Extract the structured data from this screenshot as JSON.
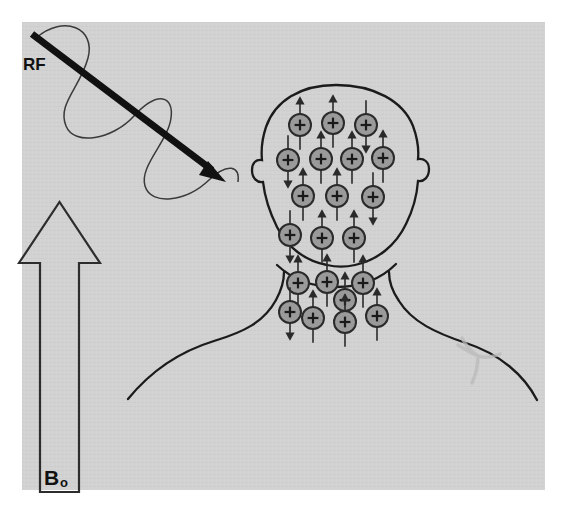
{
  "figure": {
    "panel": {
      "background_color": "#d2d2d2",
      "x": 22,
      "y": 22,
      "width": 523,
      "height": 468
    },
    "page_background": "#ffffff"
  },
  "labels": {
    "rf": "RF",
    "b0_base": "B",
    "b0_subscript": "o"
  },
  "rf_beam": {
    "name": "radiofrequency-pulse",
    "label": "RF",
    "arrow_color": "#111111",
    "wave_color": "#3a3a3a",
    "start": {
      "x": 32,
      "y": 34
    },
    "end": {
      "x": 223,
      "y": 179
    },
    "arrow_width": 7,
    "wave_cycles": 3,
    "wave_amplitude": 34
  },
  "b0_field": {
    "name": "static-magnetic-field-arrow",
    "label": "Bo",
    "direction": "up",
    "outline_color": "#2d2d2d",
    "fill_color": "#d2d2d2",
    "shaft_x": 40,
    "shaft_width": 38,
    "tip_y": 202,
    "base_y": 492,
    "head_width": 82,
    "head_height": 62
  },
  "body_outline": {
    "name": "patient-head-and-shoulders",
    "stroke_color": "#1b1b1b",
    "stroke_width": 2.3,
    "fill": "none"
  },
  "artifact": {
    "name": "shoulder-marking",
    "color": "#b9b9b9",
    "description": "faint branching mark on right shoulder"
  },
  "spin_style": {
    "circle_fill": "#9a9a9a",
    "circle_stroke": "#2a2a2a",
    "circle_radius": 11,
    "plus_color": "#1a1a1a",
    "arrow_color": "#2a2a2a",
    "arrow_length": 40,
    "symbol": "+"
  },
  "spin_groups": [
    {
      "region": "head",
      "name": "spin-group-head",
      "spins": [
        {
          "x": 300,
          "y": 125,
          "direction": "up"
        },
        {
          "x": 333,
          "y": 123,
          "direction": "up"
        },
        {
          "x": 366,
          "y": 125,
          "direction": "down"
        },
        {
          "x": 288,
          "y": 160,
          "direction": "down"
        },
        {
          "x": 321,
          "y": 159,
          "direction": "up"
        },
        {
          "x": 352,
          "y": 159,
          "direction": "up"
        },
        {
          "x": 383,
          "y": 158,
          "direction": "up"
        },
        {
          "x": 303,
          "y": 196,
          "direction": "up"
        },
        {
          "x": 337,
          "y": 196,
          "direction": "up"
        },
        {
          "x": 373,
          "y": 197,
          "direction": "down"
        },
        {
          "x": 290,
          "y": 235,
          "direction": "down"
        },
        {
          "x": 322,
          "y": 238,
          "direction": "up"
        },
        {
          "x": 354,
          "y": 238,
          "direction": "up"
        }
      ]
    },
    {
      "region": "neck",
      "name": "spin-group-neck",
      "spins": [
        {
          "x": 298,
          "y": 283,
          "direction": "up"
        },
        {
          "x": 327,
          "y": 282,
          "direction": "up"
        },
        {
          "x": 363,
          "y": 283,
          "direction": "up"
        },
        {
          "x": 345,
          "y": 300,
          "direction": "up"
        },
        {
          "x": 290,
          "y": 312,
          "direction": "down"
        },
        {
          "x": 313,
          "y": 318,
          "direction": "up"
        },
        {
          "x": 345,
          "y": 322,
          "direction": "up"
        },
        {
          "x": 377,
          "y": 316,
          "direction": "up"
        }
      ]
    }
  ]
}
